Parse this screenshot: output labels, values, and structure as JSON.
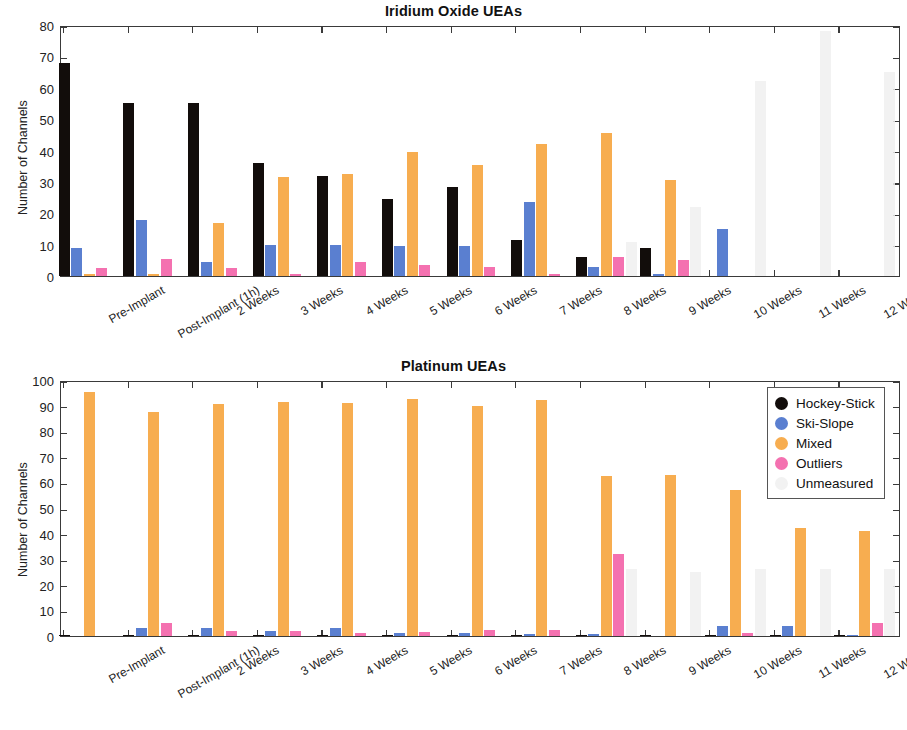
{
  "figure": {
    "ylabel": "Number of Channels"
  },
  "legend": {
    "entries": [
      {
        "label": "Hockey-Stick",
        "color": "#120d0b"
      },
      {
        "label": "Ski-Slope",
        "color": "#5a7fd0"
      },
      {
        "label": "Mixed",
        "color": "#f7ad50"
      },
      {
        "label": "Outliers",
        "color": "#f471b0"
      },
      {
        "label": "Unmeasured",
        "color": "#f0f0f0"
      }
    ]
  },
  "chart_data": [
    {
      "type": "bar",
      "title": "Iridium Oxide UEAs",
      "xlabel": "",
      "ylabel": "Number of Channels",
      "ylim": [
        0,
        80
      ],
      "yticks": [
        0,
        10,
        20,
        30,
        40,
        50,
        60,
        70,
        80
      ],
      "grid": false,
      "legend_position": "none",
      "categories": [
        "Pre-Implant",
        "Post-Implant (1h)",
        "2 Weeks",
        "3 Weeks",
        "4 Weeks",
        "5 Weeks",
        "6 Weeks",
        "7 Weeks",
        "8 Weeks",
        "9 Weeks",
        "10 Weeks",
        "11 Weeks",
        "12 Weeks"
      ],
      "series": [
        {
          "name": "Hockey-Stick",
          "color": "#120d0b",
          "values": [
            68,
            55,
            55,
            36,
            32,
            24.5,
            28.5,
            11.5,
            6,
            9,
            0,
            0,
            0
          ]
        },
        {
          "name": "Ski-Slope",
          "color": "#5a7fd0",
          "values": [
            9,
            18,
            4.5,
            10,
            10,
            9.5,
            9.5,
            23.5,
            3,
            0.5,
            15,
            0,
            0
          ]
        },
        {
          "name": "Mixed",
          "color": "#f7ad50",
          "values": [
            0.5,
            0.5,
            17,
            31.5,
            32.5,
            39.5,
            35.5,
            42,
            45.5,
            30.5,
            0,
            0,
            0
          ]
        },
        {
          "name": "Outliers",
          "color": "#f471b0",
          "values": [
            2.5,
            5.5,
            2.5,
            0.8,
            4.5,
            3.5,
            3,
            0.5,
            6,
            5,
            0,
            0,
            0
          ]
        },
        {
          "name": "Unmeasured",
          "color": "#f0f0f0",
          "values": [
            0,
            0,
            0,
            0,
            0,
            0,
            0,
            0,
            11,
            22,
            62,
            78,
            65
          ]
        }
      ]
    },
    {
      "type": "bar",
      "title": "Platinum UEAs",
      "xlabel": "",
      "ylabel": "Number of Channels",
      "ylim": [
        0,
        100
      ],
      "yticks": [
        0,
        10,
        20,
        30,
        40,
        50,
        60,
        70,
        80,
        90,
        100
      ],
      "grid": false,
      "legend_position": "top-right",
      "categories": [
        "Pre-Implant",
        "Post-Implant (1h)",
        "2 Weeks",
        "3 Weeks",
        "4 Weeks",
        "5 Weeks",
        "6 Weeks",
        "7 Weeks",
        "8 Weeks",
        "9 Weeks",
        "10 Weeks",
        "11 Weeks",
        "12 Weeks"
      ],
      "series": [
        {
          "name": "Hockey-Stick",
          "color": "#120d0b",
          "values": [
            0.3,
            0.3,
            0.3,
            0.3,
            0.3,
            0.3,
            0.3,
            0.3,
            0.3,
            0.3,
            0.3,
            0.3,
            0.3
          ]
        },
        {
          "name": "Ski-Slope",
          "color": "#5a7fd0",
          "values": [
            0,
            3,
            3,
            2,
            3,
            1.2,
            1.2,
            0.8,
            0.8,
            0,
            4,
            4,
            0.5
          ]
        },
        {
          "name": "Mixed",
          "color": "#f7ad50",
          "values": [
            95.5,
            87.5,
            90.5,
            91.5,
            91,
            92.5,
            90,
            92,
            62.5,
            63,
            57,
            42,
            41
          ]
        },
        {
          "name": "Outliers",
          "color": "#f471b0",
          "values": [
            0,
            5,
            2,
            2,
            1,
            1.5,
            2.5,
            2.5,
            32,
            0,
            1,
            0,
            5
          ]
        },
        {
          "name": "Unmeasured",
          "color": "#f0f0f0",
          "values": [
            0,
            0,
            0,
            0,
            0,
            0,
            0,
            0,
            26,
            25,
            26,
            26,
            26
          ]
        }
      ]
    }
  ]
}
